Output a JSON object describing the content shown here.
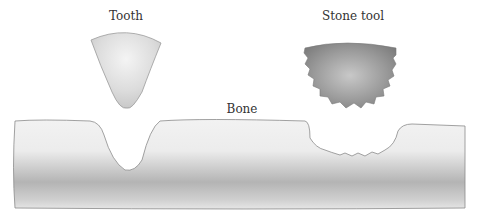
{
  "diagram": {
    "labels": {
      "tooth": "Tooth",
      "stone_tool": "Stone tool",
      "bone": "Bone"
    },
    "colors": {
      "background": "#ffffff",
      "outline": "#8a8a8a",
      "tooth_fill": "#d4d4d4",
      "stone_fill": "#8c8c8c",
      "bone_fill": "#c8c8c8"
    }
  }
}
